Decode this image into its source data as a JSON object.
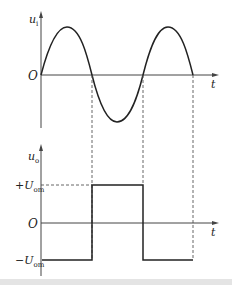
{
  "figure": {
    "top_plot": {
      "ylabel": "u",
      "ylabel_sub": "i",
      "origin_label": "O",
      "xlabel": "t",
      "waveform": "sine",
      "zero_crossings_x": [
        41,
        92,
        143,
        193
      ]
    },
    "bottom_plot": {
      "ylabel": "u",
      "ylabel_sub": "o",
      "origin_label": "O",
      "xlabel": "t",
      "high_label_sign": "+",
      "low_label_sign": "−",
      "level_symbol": "U",
      "level_sub": "om",
      "waveform": "square",
      "segments": [
        {
          "from": "O",
          "to": "first zero crossing",
          "level": "-U_om"
        },
        {
          "from": "first zero crossing",
          "to": "second zero crossing",
          "level": "+U_om"
        },
        {
          "from": "second zero crossing",
          "to": "third zero crossing",
          "level": "-U_om"
        }
      ]
    },
    "colors": {
      "line": "#222222",
      "axis": "#444444",
      "dashed": "#555555"
    }
  }
}
